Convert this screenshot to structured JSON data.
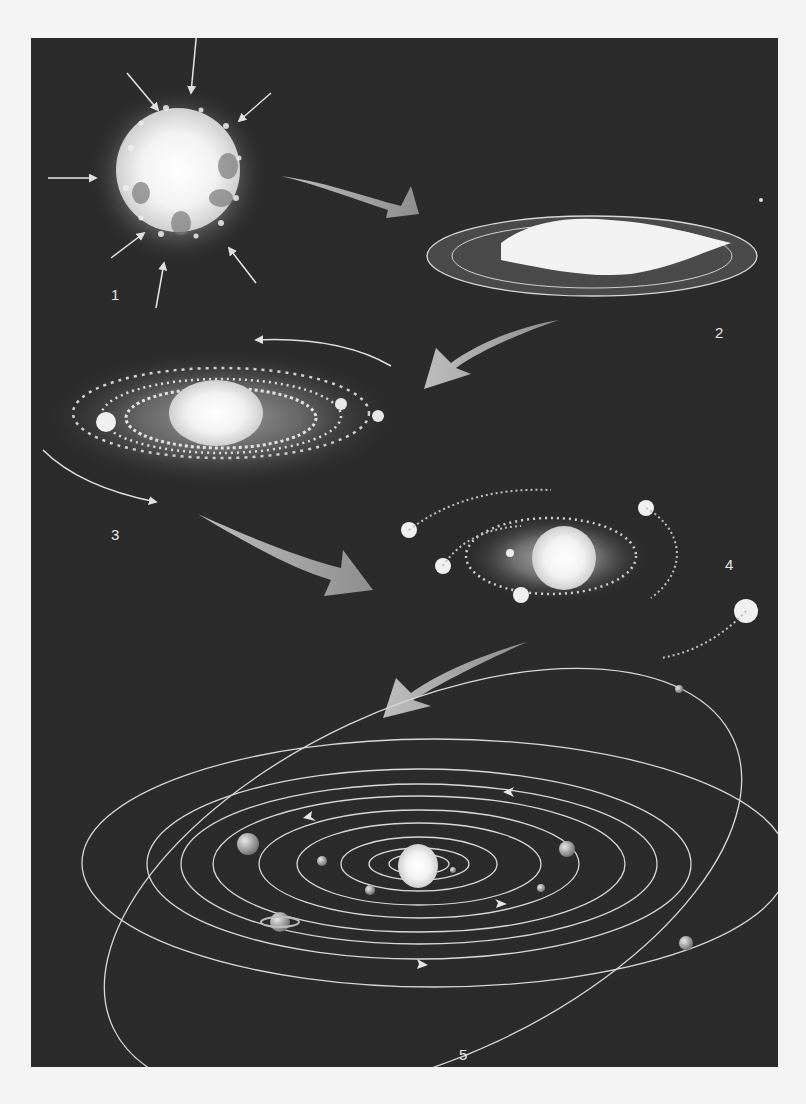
{
  "figure": {
    "background_color": "#2b2b2b",
    "page_color": "#f4f4f4",
    "arrow_color": "#9a9a9a",
    "orbit_color": "#d8d8d8",
    "stages": [
      {
        "id": 1,
        "label": "1",
        "description": "Collapsing gas cloud with inward-pointing arrows"
      },
      {
        "id": 2,
        "label": "2",
        "description": "Flattened rotating disk"
      },
      {
        "id": 3,
        "label": "3",
        "description": "Central protostar with dust rings and clumps"
      },
      {
        "id": 4,
        "label": "4",
        "description": "Protoplanets sweeping up material along orbits"
      },
      {
        "id": 5,
        "label": "5",
        "description": "Solar system with planets on elliptical orbits"
      }
    ]
  }
}
